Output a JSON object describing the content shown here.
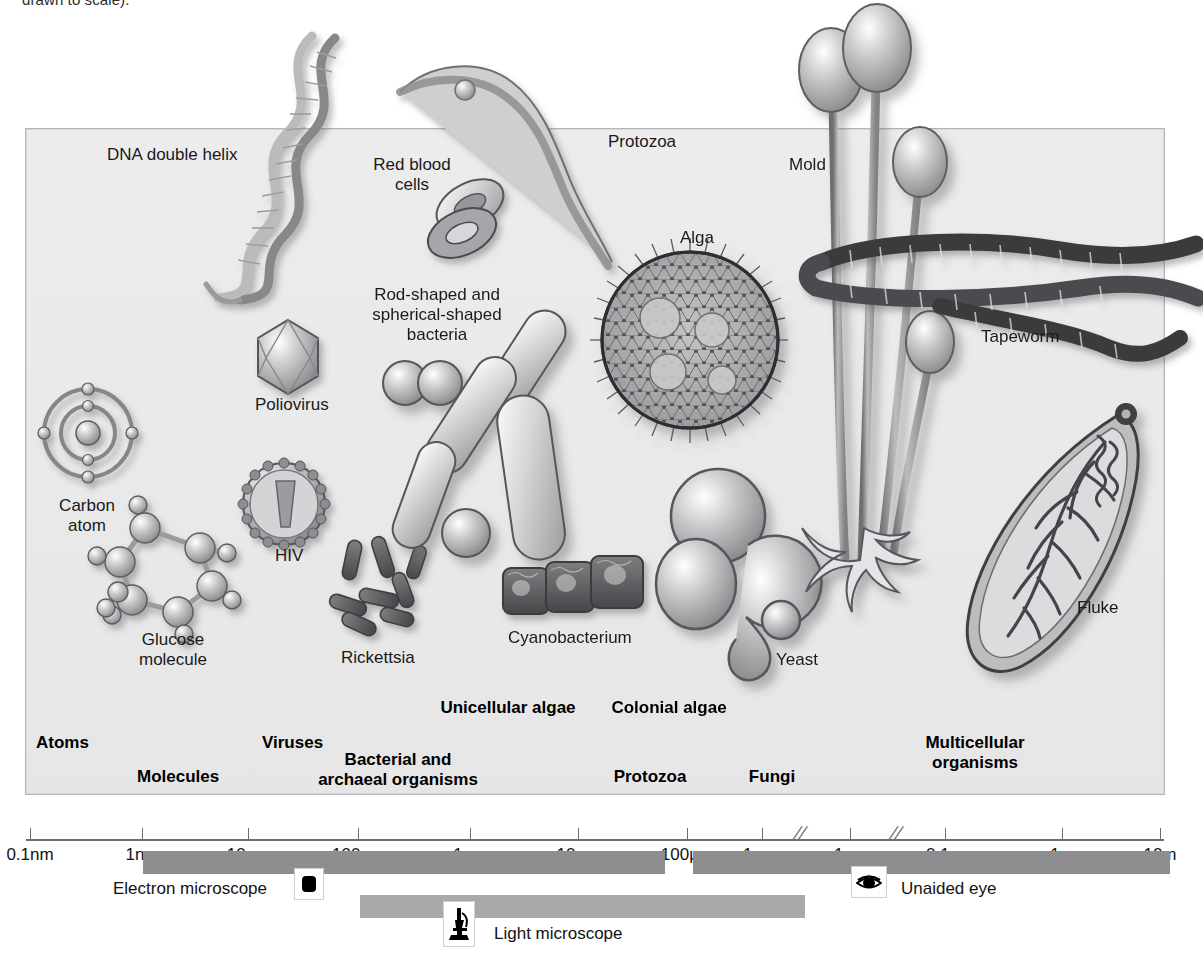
{
  "caption_fragment": "drawn to scale).",
  "panel": {
    "background_color": "#ebebec",
    "border_color": "#b6b6b8"
  },
  "organism_labels": [
    {
      "name": "dna-double-helix",
      "text": "DNA double helix",
      "x": 107,
      "y": 145,
      "align": "left"
    },
    {
      "name": "red-blood-cells",
      "text": "Red blood\ncells",
      "x": 412,
      "y": 155,
      "align": "center"
    },
    {
      "name": "protozoa",
      "text": "Protozoa",
      "x": 608,
      "y": 132,
      "align": "left"
    },
    {
      "name": "mold",
      "text": "Mold",
      "x": 789,
      "y": 155,
      "align": "left"
    },
    {
      "name": "alga",
      "text": "Alga",
      "x": 697,
      "y": 228,
      "align": "center"
    },
    {
      "name": "rod-and-spherical-bacteria",
      "text": "Rod-shaped and\nspherical-shaped\nbacteria",
      "x": 437,
      "y": 285,
      "align": "center"
    },
    {
      "name": "tapeworm",
      "text": "Tapeworm",
      "x": 981,
      "y": 327,
      "align": "left"
    },
    {
      "name": "poliovirus",
      "text": "Poliovirus",
      "x": 255,
      "y": 395,
      "align": "left"
    },
    {
      "name": "carbon-atom",
      "text": "Carbon\natom",
      "x": 87,
      "y": 496,
      "align": "center"
    },
    {
      "name": "hiv",
      "text": "HIV",
      "x": 275,
      "y": 546,
      "align": "left"
    },
    {
      "name": "glucose-molecule",
      "text": "Glucose\nmolecule",
      "x": 173,
      "y": 630,
      "align": "center"
    },
    {
      "name": "rickettsia",
      "text": "Rickettsia",
      "x": 341,
      "y": 648,
      "align": "left"
    },
    {
      "name": "cyanobacterium",
      "text": "Cyanobacterium",
      "x": 508,
      "y": 628,
      "align": "left"
    },
    {
      "name": "yeast",
      "text": "Yeast",
      "x": 776,
      "y": 650,
      "align": "left"
    },
    {
      "name": "fluke",
      "text": "Fluke",
      "x": 1077,
      "y": 598,
      "align": "left"
    }
  ],
  "category_labels": [
    {
      "name": "unicellular-algae",
      "text": "Unicellular algae",
      "x": 508,
      "y": 698,
      "align": "center"
    },
    {
      "name": "colonial-algae",
      "text": "Colonial algae",
      "x": 669,
      "y": 698,
      "align": "center"
    },
    {
      "name": "atoms",
      "text": "Atoms",
      "x": 36,
      "y": 733,
      "align": "left"
    },
    {
      "name": "viruses",
      "text": "Viruses",
      "x": 262,
      "y": 733,
      "align": "left"
    },
    {
      "name": "multicellular-organisms",
      "text": "Multicellular\norganisms",
      "x": 975,
      "y": 733,
      "align": "center"
    },
    {
      "name": "bacterial-and-archaeal-organisms",
      "text": "Bacterial and\narchaeal organisms",
      "x": 398,
      "y": 750,
      "align": "center"
    },
    {
      "name": "molecules",
      "text": "Molecules",
      "x": 137,
      "y": 767,
      "align": "left"
    },
    {
      "name": "protozoa-category",
      "text": "Protozoa",
      "x": 650,
      "y": 767,
      "align": "center"
    },
    {
      "name": "fungi",
      "text": "Fungi",
      "x": 772,
      "y": 767,
      "align": "center"
    }
  ],
  "chart_data": {
    "type": "scale-bar",
    "xlabel": "",
    "ticks": [
      {
        "label": "0.1nm",
        "x": 30
      },
      {
        "label": "1nm",
        "x": 142
      },
      {
        "label": "10nm",
        "x": 248
      },
      {
        "label": "100nm",
        "x": 358
      },
      {
        "label": "1µm",
        "x": 470
      },
      {
        "label": "10µm",
        "x": 578
      },
      {
        "label": "100µm",
        "x": 687
      },
      {
        "label": "1mm",
        "x": 762
      },
      {
        "label": "1cm",
        "x": 850
      },
      {
        "label": "0.1m",
        "x": 945
      },
      {
        "label": "1m",
        "x": 1062
      },
      {
        "label": "10m",
        "x": 1160
      }
    ],
    "axis_breaks": [
      800,
      896
    ],
    "ranges": [
      {
        "name": "electron-microscope",
        "label": "Electron microscope",
        "from": "1nm",
        "to": "100µm",
        "x": 143,
        "width": 522,
        "y": 851,
        "shade": "dark",
        "icon": "electron-microscope-icon",
        "icon_x": 294,
        "icon_y": 868,
        "text_x": 113,
        "text_y": 879
      },
      {
        "name": "light-microscope",
        "label": "Light microscope",
        "from": "100nm",
        "to": "1mm",
        "x": 360,
        "width": 445,
        "y": 895,
        "shade": "light",
        "icon": "light-microscope-icon",
        "icon_x": 443,
        "icon_y": 901,
        "text_x": 494,
        "text_y": 924
      },
      {
        "name": "unaided-eye",
        "label": "Unaided eye",
        "from": "1mm",
        "to": "10m",
        "x": 693,
        "width": 477,
        "y": 851,
        "shade": "dark",
        "icon": "eye-icon",
        "icon_x": 851,
        "icon_y": 866,
        "text_x": 901,
        "text_y": 879
      }
    ],
    "colors": {
      "bar_dark": "#8e8e90",
      "bar_light": "#a9a9ab",
      "axis": "#6e6e70",
      "panel": "#ebebec"
    }
  }
}
